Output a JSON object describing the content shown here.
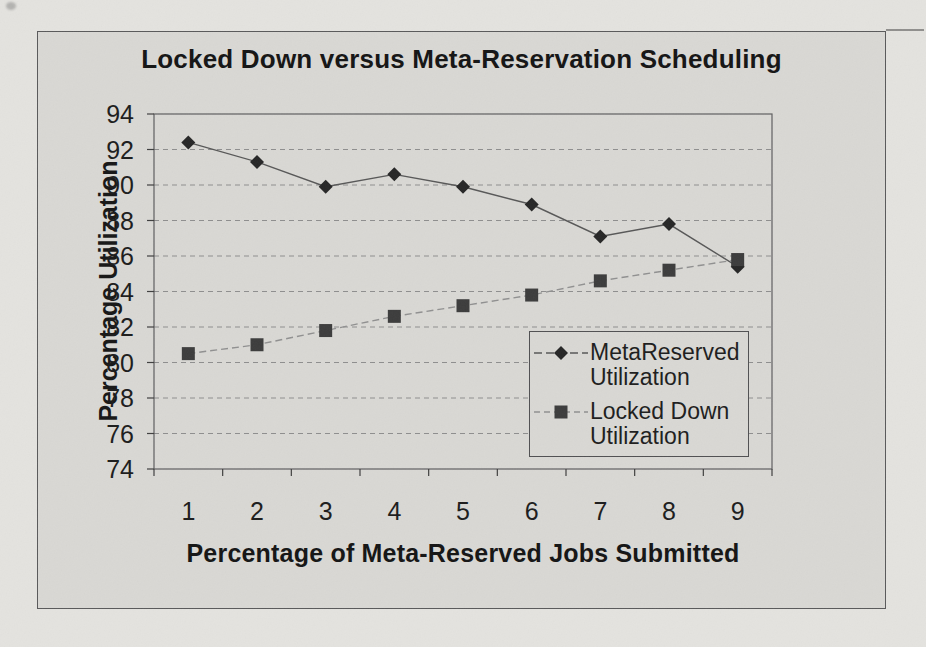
{
  "page": {
    "paper_color": "#e4e3df",
    "chart_background": "#d9d8d4"
  },
  "chart": {
    "title": "Locked Down versus Meta-Reservation Scheduling",
    "y_axis": {
      "title": "Percentage Utilization",
      "tick_labels": [
        "94",
        "92",
        "90",
        "88",
        "86",
        "84",
        "82",
        "80",
        "78",
        "76",
        "74"
      ]
    },
    "x_axis": {
      "title": "Percentage of Meta-Reserved Jobs Submitted",
      "tick_labels": [
        "1",
        "2",
        "3",
        "4",
        "5",
        "6",
        "7",
        "8",
        "9"
      ]
    },
    "legend": {
      "entries": [
        {
          "line1": "MetaReserved",
          "line2": "Utilization",
          "marker": "diamond"
        },
        {
          "line1": "Locked Down",
          "line2": "Utilization",
          "marker": "square"
        }
      ]
    }
  },
  "chart_data": {
    "type": "line",
    "x": [
      1,
      2,
      3,
      4,
      5,
      6,
      7,
      8,
      9
    ],
    "series": [
      {
        "name": "MetaReserved Utilization",
        "marker": "diamond",
        "marker_color": "#262626",
        "line_color": "#575757",
        "line_style": "solid",
        "values": [
          92.4,
          91.3,
          89.9,
          90.6,
          89.9,
          88.9,
          87.1,
          87.8,
          85.4
        ]
      },
      {
        "name": "Locked Down Utilization",
        "marker": "square",
        "marker_color": "#3c3c3c",
        "line_color": "#909090",
        "line_style": "dashed",
        "values": [
          80.5,
          81.0,
          81.8,
          82.6,
          83.2,
          83.8,
          84.6,
          85.2,
          85.8
        ]
      }
    ],
    "title": "Locked Down versus Meta-Reservation Scheduling",
    "xlabel": "Percentage of Meta-Reserved Jobs Submitted",
    "ylabel": "Percentage Utilization",
    "ylim": [
      74,
      94
    ],
    "ytick_step": 2,
    "xticks": [
      1,
      2,
      3,
      4,
      5,
      6,
      7,
      8,
      9
    ],
    "grid": "horizontal-dashed",
    "gridline_color": "#8e8e8e",
    "legend_position": "inside-lower-right"
  }
}
